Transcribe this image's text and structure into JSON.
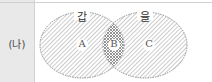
{
  "row_label": "(나)",
  "sets": [
    {
      "name": "갑",
      "region": "A"
    },
    {
      "name": "을",
      "region": "C"
    }
  ],
  "intersection_label": "B",
  "region_labels": [
    "A",
    "B",
    "C"
  ],
  "colors": {
    "label_cell_bg": "#e9e9e9",
    "stroke": "#777777",
    "hatch": "#999999"
  }
}
